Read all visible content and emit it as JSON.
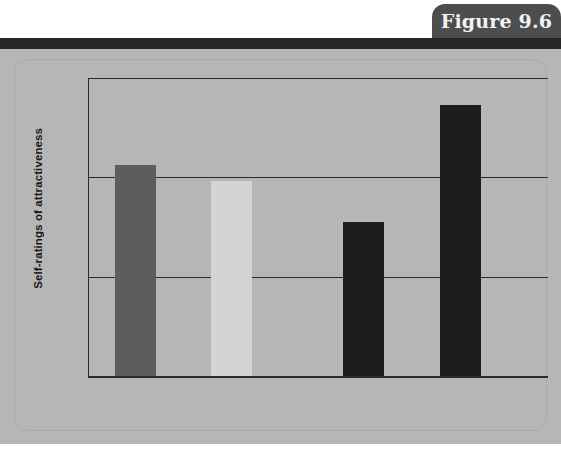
{
  "figure": {
    "tab_label": "Figure 9.6"
  },
  "chart_data": {
    "type": "bar",
    "title": "",
    "xlabel": "",
    "ylabel": "Self-ratings of attractiveness",
    "ylim": [
      1.0,
      4.0
    ],
    "ytick_labels": [
      "4.0",
      "3.0",
      "2.0",
      "1.0"
    ],
    "ytick_values": [
      4.0,
      3.0,
      2.0,
      1.0
    ],
    "grid": true,
    "legend": "none",
    "categories": [
      "Attractive",
      "Unattractive",
      "Attractive",
      "Unattractive"
    ],
    "values": [
      3.12,
      2.96,
      2.55,
      3.73
    ],
    "bar_colors": [
      "#5d5d5d",
      "#d4d4d4",
      "#1c1c1c",
      "#1c1c1c"
    ],
    "groups": [
      {
        "label": "Other-sex target",
        "categories": [
          "Attractive",
          "Unattractive"
        ]
      },
      {
        "label": "Same-sex target",
        "categories": [
          "Attractive",
          "Unattractive"
        ]
      }
    ],
    "group_labels": [
      "Other-sex target",
      "Same-sex target"
    ]
  },
  "colors": {
    "panel_background": "#b6b6b6",
    "header_rule": "#262626",
    "tab_background": "#4d4d4d",
    "tab_text": "#f2f2f2",
    "axis": "#2b2b2b"
  }
}
